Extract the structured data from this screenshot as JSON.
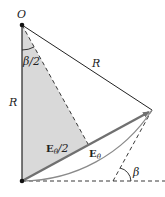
{
  "diagram": {
    "labels": {
      "origin": "O",
      "radius_left": "R",
      "radius_right": "R",
      "half_angle": "β/2",
      "half_vector": "E",
      "half_vector_sub": "θ",
      "half_vector_suffix": "/2",
      "vector": "E",
      "vector_sub": "θ",
      "angle": "β"
    },
    "colors": {
      "shade": "#d9d9d9",
      "line": "#222222",
      "vector": "#707070",
      "arc": "#8a8a8a"
    }
  }
}
